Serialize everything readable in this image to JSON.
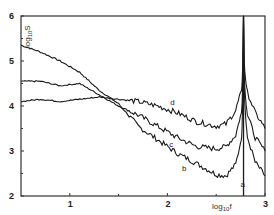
{
  "chart_data": {
    "type": "line",
    "title": "",
    "xlabel": "log10 f",
    "ylabel": "log10 S",
    "xlim": [
      0.5,
      3.0
    ],
    "ylim": [
      2,
      6
    ],
    "x_ticks": [
      1,
      2,
      3
    ],
    "x_tick_labels": [
      "1",
      "2",
      "3"
    ],
    "y_ticks": [
      2,
      3,
      4,
      5,
      6
    ],
    "y_tick_labels": [
      "2",
      "3",
      "4",
      "5",
      "6"
    ],
    "grid": false,
    "legend": "inline curve labels",
    "annotations": [
      {
        "text": "a",
        "x": 2.75,
        "y": 2.2,
        "note": "vertical line at resonance peak"
      },
      {
        "text": "b",
        "x": 2.15,
        "y": 2.55
      },
      {
        "text": "c",
        "x": 2.02,
        "y": 3.1
      },
      {
        "text": "d",
        "x": 2.03,
        "y": 4.03
      }
    ],
    "vertical_line": {
      "label": "a",
      "x": 2.78
    },
    "series": [
      {
        "name": "b",
        "x": [
          0.5,
          0.7,
          0.9,
          1.1,
          1.3,
          1.5,
          1.7,
          1.9,
          2.1,
          2.3,
          2.5,
          2.6,
          2.7,
          2.75,
          2.78,
          2.82,
          2.9,
          3.0
        ],
        "y": [
          5.35,
          5.2,
          5.0,
          4.75,
          4.35,
          4.05,
          3.55,
          3.25,
          2.95,
          2.72,
          2.48,
          2.45,
          2.7,
          3.2,
          6.0,
          3.3,
          2.75,
          2.45
        ]
      },
      {
        "name": "c",
        "x": [
          0.5,
          0.7,
          0.9,
          1.1,
          1.3,
          1.5,
          1.7,
          1.9,
          2.1,
          2.3,
          2.5,
          2.6,
          2.7,
          2.75,
          2.78,
          2.82,
          2.9,
          3.0
        ],
        "y": [
          4.55,
          4.55,
          4.45,
          4.5,
          4.25,
          4.0,
          3.8,
          3.55,
          3.3,
          3.1,
          3.05,
          3.1,
          3.35,
          3.8,
          6.0,
          3.8,
          3.3,
          3.0
        ]
      },
      {
        "name": "d",
        "x": [
          0.5,
          0.7,
          0.9,
          1.1,
          1.3,
          1.5,
          1.7,
          1.9,
          2.1,
          2.3,
          2.5,
          2.6,
          2.7,
          2.75,
          2.78,
          2.82,
          2.9,
          3.0
        ],
        "y": [
          4.1,
          4.15,
          4.1,
          4.15,
          4.2,
          4.15,
          4.1,
          4.0,
          3.85,
          3.65,
          3.55,
          3.6,
          3.9,
          4.3,
          6.0,
          4.3,
          3.85,
          3.5
        ]
      }
    ]
  },
  "labels": {
    "x_axis": "log",
    "x_axis_sub": "10",
    "x_axis_var": "f",
    "y_axis": "log",
    "y_axis_sub": "10",
    "y_axis_var": "S"
  },
  "colors": {
    "line": "#1a1a1a",
    "axis": "#333333",
    "background": "#ffffff"
  }
}
